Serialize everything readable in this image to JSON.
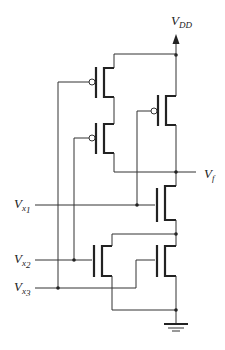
{
  "diagram": {
    "type": "CMOS logic gate schematic",
    "labels": {
      "supply": {
        "main": "V",
        "sub": "DD"
      },
      "output": {
        "main": "V",
        "sub": "f"
      },
      "input1": {
        "main": "V",
        "sub": "x",
        "subsub": "1"
      },
      "input2": {
        "main": "V",
        "sub": "x",
        "subsub": "2"
      },
      "input3": {
        "main": "V",
        "sub": "x",
        "subsub": "3"
      }
    },
    "transistors": [
      {
        "id": "P1",
        "type": "pMOS",
        "gate": "x3",
        "position": "top-left pull-up"
      },
      {
        "id": "P2",
        "type": "pMOS",
        "gate": "x2",
        "position": "bottom-left pull-up (series with P1)"
      },
      {
        "id": "P3",
        "type": "pMOS",
        "gate": "x1",
        "position": "right pull-up (parallel)"
      },
      {
        "id": "N1",
        "type": "nMOS",
        "gate": "x1",
        "position": "top pull-down"
      },
      {
        "id": "N2",
        "type": "nMOS",
        "gate": "x2",
        "position": "bottom-left pull-down"
      },
      {
        "id": "N3",
        "type": "nMOS",
        "gate": "x3",
        "position": "bottom-right pull-down"
      }
    ],
    "colors": {
      "line": "#222222",
      "background": "#ffffff"
    }
  }
}
